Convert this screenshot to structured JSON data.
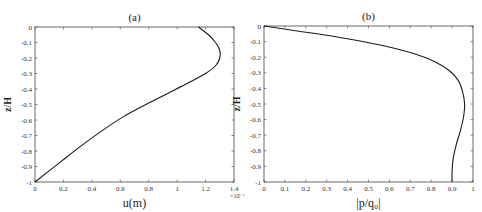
{
  "chart_data": [
    {
      "type": "line",
      "title": "(a)",
      "xlabel": "u(m)",
      "ylabel": "z/H",
      "x_multiplier": "×10⁻⁷",
      "xlim": [
        0,
        1.4
      ],
      "ylim": [
        -1,
        0
      ],
      "xticks": [
        "0",
        "0.2",
        "0.4",
        "0.6",
        "0.8",
        "1",
        "1.2",
        "1.4"
      ],
      "yticks": [
        "0",
        "-0.1",
        "-0.2",
        "-0.3",
        "-0.4",
        "-0.5",
        "-0.6",
        "-0.7",
        "-0.8",
        "-0.9",
        "-1"
      ],
      "grid": false,
      "series": [
        {
          "name": "u",
          "x": [
            1.15,
            1.22,
            1.27,
            1.3,
            1.3,
            1.27,
            1.2,
            1.08,
            0.93,
            0.78,
            0.62,
            0.47,
            0.32,
            0.18,
            0.0
          ],
          "y": [
            0.0,
            -0.05,
            -0.1,
            -0.15,
            -0.2,
            -0.25,
            -0.3,
            -0.36,
            -0.43,
            -0.5,
            -0.58,
            -0.67,
            -0.77,
            -0.87,
            -1.0
          ]
        }
      ]
    },
    {
      "type": "line",
      "title": "(b)",
      "xlabel": "|p/q₀|",
      "ylabel": "z/H",
      "xlim": [
        0,
        1
      ],
      "ylim": [
        -1,
        0
      ],
      "xticks": [
        "0",
        "0.1",
        "0.2",
        "0.3",
        "0.4",
        "0.5",
        "0.6",
        "0.7",
        "0.8",
        "0.9",
        "1"
      ],
      "yticks": [
        "0",
        "-0.1",
        "-0.2",
        "-0.3",
        "-0.4",
        "-0.5",
        "-0.6",
        "-0.7",
        "-0.8",
        "-0.9",
        "-1"
      ],
      "grid": false,
      "series": [
        {
          "name": "|p/q0|",
          "x": [
            0.0,
            0.15,
            0.35,
            0.55,
            0.7,
            0.82,
            0.89,
            0.93,
            0.95,
            0.96,
            0.955,
            0.94,
            0.92,
            0.905,
            0.9,
            0.9
          ],
          "y": [
            0.0,
            -0.03,
            -0.07,
            -0.12,
            -0.17,
            -0.23,
            -0.29,
            -0.35,
            -0.42,
            -0.5,
            -0.58,
            -0.67,
            -0.76,
            -0.85,
            -0.93,
            -1.0
          ]
        }
      ]
    }
  ]
}
